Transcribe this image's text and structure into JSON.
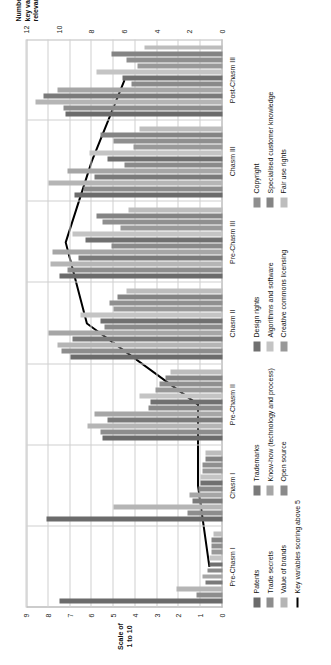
{
  "chart_data": {
    "type": "bar",
    "orientation": "horizontal-rotated",
    "title": "",
    "xlabel": "",
    "ylabel": "Scale of 1 to 10",
    "y2label": "Number of key variables relevant for stage",
    "ylim": [
      0,
      9
    ],
    "y2lim": [
      0,
      12
    ],
    "grid": true,
    "legend_position": "bottom",
    "categories": [
      "Pre-Chasm I",
      "Chasm I",
      "Pre-Chasm II",
      "Chasm II",
      "Pre-Chasm III",
      "Chasm III",
      "Post-Chasm III"
    ],
    "y_ticks": [
      "0",
      "1",
      "2",
      "3",
      "4",
      "5",
      "6",
      "7",
      "8",
      "9"
    ],
    "y2_ticks": [
      "0",
      "2",
      "4",
      "6",
      "8",
      "10",
      "12"
    ],
    "series": [
      {
        "name": "Patents",
        "color": "#6b6b6b",
        "values": [
          7.5,
          8.1,
          5.5,
          7.0,
          7.5,
          6.8,
          7.2
        ]
      },
      {
        "name": "Trade secrets",
        "color": "#8d8d8d",
        "values": [
          1.2,
          1.6,
          5.6,
          7.4,
          7.1,
          6.4,
          7.3
        ]
      },
      {
        "name": "Value of brands",
        "color": "#b5b5b5",
        "values": [
          2.1,
          5.0,
          6.2,
          7.6,
          7.9,
          8.0,
          8.6
        ]
      },
      {
        "name": "Trademarks",
        "color": "#7a7a7a",
        "values": [
          0.8,
          1.4,
          5.3,
          6.9,
          6.6,
          5.9,
          8.2
        ]
      },
      {
        "name": "Know-how (technology and process)",
        "color": "#a6a6a6",
        "values": [
          0.9,
          1.5,
          5.9,
          8.0,
          7.8,
          7.1,
          7.6
        ]
      },
      {
        "name": "Open source",
        "color": "#8a8a8a",
        "values": [
          0.7,
          1.1,
          3.4,
          5.4,
          5.1,
          4.5,
          4.2
        ]
      },
      {
        "name": "Design rights",
        "color": "#707070",
        "values": [
          0.6,
          1.0,
          3.3,
          5.6,
          6.3,
          5.3,
          4.6
        ]
      },
      {
        "name": "Algorithms and software",
        "color": "#c4c4c4",
        "values": [
          0.6,
          1.0,
          3.8,
          6.5,
          6.9,
          6.1,
          5.8
        ]
      },
      {
        "name": "Creative commons licensing",
        "color": "#999999",
        "values": [
          0.5,
          0.9,
          3.1,
          5.0,
          4.7,
          4.1,
          3.9
        ]
      },
      {
        "name": "Copyright",
        "color": "#8f8f8f",
        "values": [
          0.5,
          0.9,
          2.9,
          5.2,
          5.5,
          5.0,
          4.4
        ]
      },
      {
        "name": "Specialised customer knowledge",
        "color": "#848484",
        "values": [
          0.5,
          0.8,
          2.6,
          4.8,
          5.8,
          5.6,
          5.1
        ]
      },
      {
        "name": "Fair use rights",
        "color": "#bdbdbd",
        "values": [
          0.4,
          0.8,
          2.4,
          4.4,
          4.3,
          3.8,
          3.6
        ]
      }
    ],
    "line_series": {
      "name": "Key variables scoring above 5",
      "color": "#000000",
      "axis": "secondary",
      "values": [
        0.8,
        1.5,
        1.5,
        8.3,
        9.6,
        8.0,
        6.0
      ]
    }
  },
  "legend": {
    "columns": [
      {
        "items": [
          {
            "label": "Patents",
            "color": "#6b6b6b",
            "kind": "swatch"
          },
          {
            "label": "Trade secrets",
            "color": "#8d8d8d",
            "kind": "swatch"
          },
          {
            "label": "Value of brands",
            "color": "#b5b5b5",
            "kind": "swatch"
          },
          {
            "label": "Key variables scoring above 5",
            "color": "#000000",
            "kind": "line"
          }
        ]
      },
      {
        "items": [
          {
            "label": "Trademarks",
            "color": "#7a7a7a",
            "kind": "swatch"
          },
          {
            "label": "Know-how (technology and process)",
            "color": "#a6a6a6",
            "kind": "swatch"
          },
          {
            "label": "Open source",
            "color": "#8a8a8a",
            "kind": "swatch"
          }
        ]
      },
      {
        "items": [
          {
            "label": "Design rights",
            "color": "#707070",
            "kind": "swatch"
          },
          {
            "label": "Algorithms and software",
            "color": "#c4c4c4",
            "kind": "swatch"
          },
          {
            "label": "Creative commons licensing",
            "color": "#999999",
            "kind": "swatch"
          }
        ]
      },
      {
        "items": [
          {
            "label": "Copyright",
            "color": "#8f8f8f",
            "kind": "swatch"
          },
          {
            "label": "Specialised customer knowledge",
            "color": "#848484",
            "kind": "swatch"
          },
          {
            "label": "Fair use rights",
            "color": "#bdbdbd",
            "kind": "swatch"
          }
        ]
      }
    ]
  }
}
